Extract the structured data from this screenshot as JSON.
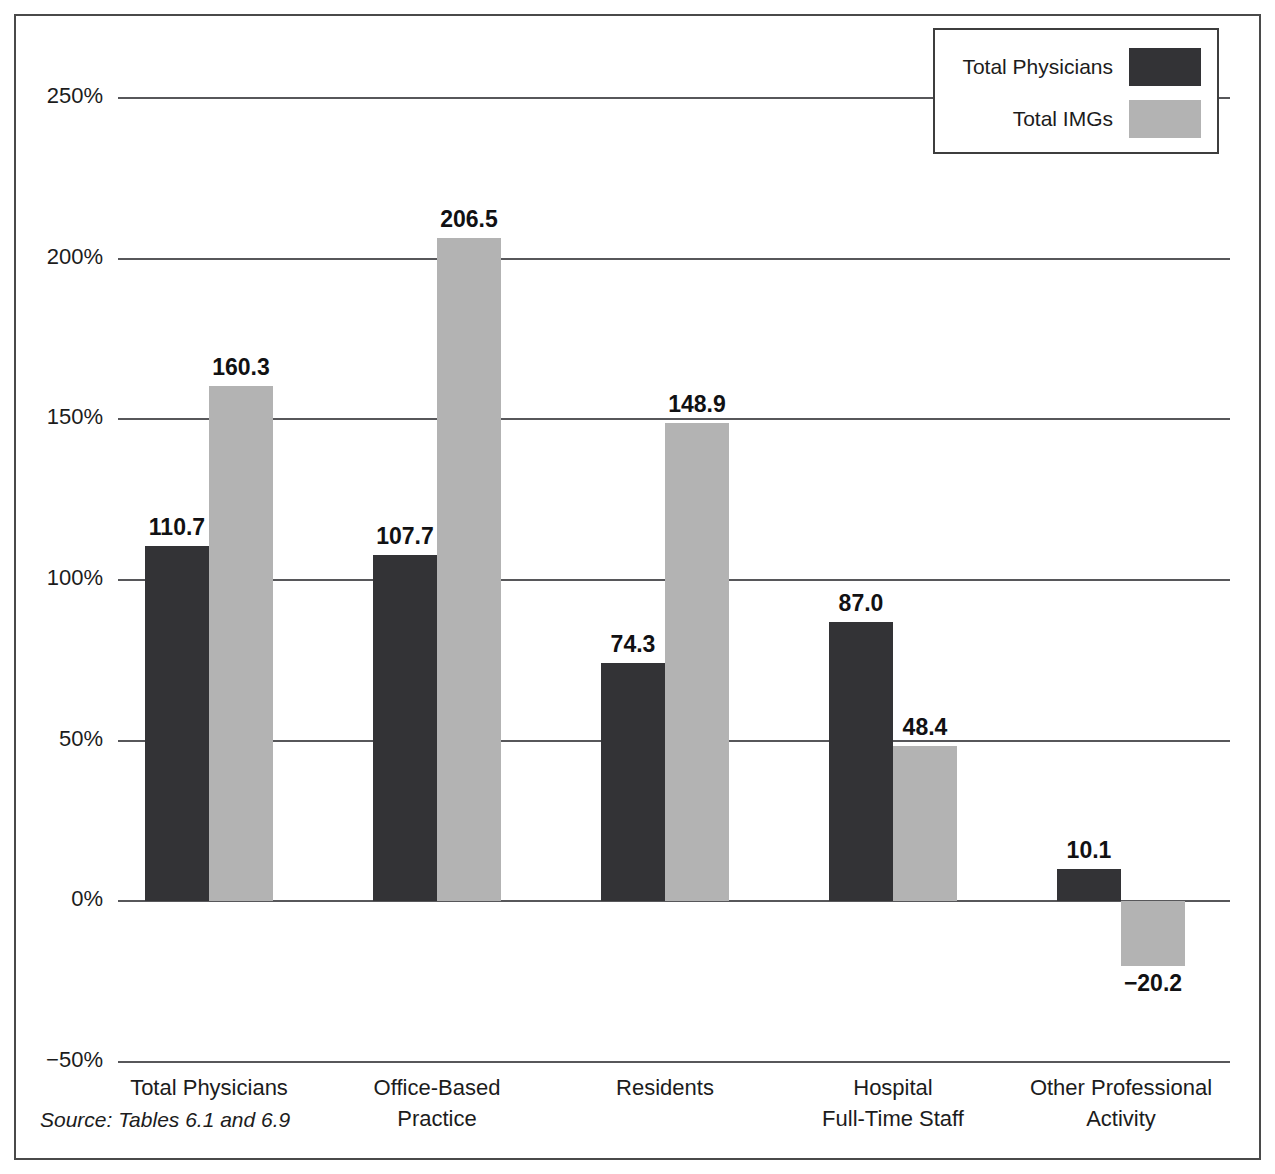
{
  "legend": {
    "entries": [
      {
        "label": "Total Physicians",
        "color": "#333336"
      },
      {
        "label": "Total IMGs",
        "color": "#b3b3b3"
      }
    ]
  },
  "source_note": "Source: Tables 6.1 and 6.9",
  "chart_data": {
    "type": "bar",
    "title": "",
    "subtitle": "",
    "xlabel": "",
    "ylabel": "",
    "ylim": [
      -50,
      250
    ],
    "yticks": [
      250,
      200,
      150,
      100,
      50,
      0,
      -50
    ],
    "ytick_labels": [
      "250%",
      "200%",
      "150%",
      "100%",
      "50%",
      "0%",
      "-50%"
    ],
    "grid": true,
    "legend_position": "top-right",
    "categories": [
      "Total Physicians",
      "Office-Based\nPractice",
      "Residents",
      "Hospital\nFull-Time Staff",
      "Other Professional\nActivity"
    ],
    "series": [
      {
        "name": "Total Physicians",
        "color": "#333336",
        "values": [
          110.7,
          107.7,
          74.3,
          87.0,
          10.1
        ],
        "value_labels": [
          "110.7",
          "107.7",
          "74.3",
          "87.0",
          "10.1"
        ]
      },
      {
        "name": "Total IMGs",
        "color": "#b3b3b3",
        "values": [
          160.3,
          206.5,
          148.9,
          48.4,
          -20.2
        ],
        "value_labels": [
          "160.3",
          "206.5",
          "148.9",
          "48.4",
          "−20.2"
        ]
      }
    ]
  }
}
